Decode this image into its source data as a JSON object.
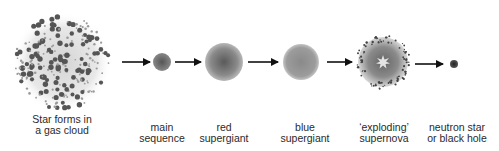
{
  "diagram": {
    "stages": [
      {
        "id": "gas-cloud",
        "line1": "Star forms in",
        "line2": "a gas cloud",
        "cx": 62,
        "cy": 62,
        "r": 48
      },
      {
        "id": "main-sequence",
        "line1": "main",
        "line2": "sequence",
        "cx": 162,
        "cy": 62,
        "r": 9
      },
      {
        "id": "red-supergiant",
        "line1": "red",
        "line2": "supergiant",
        "cx": 224,
        "cy": 62,
        "r": 19
      },
      {
        "id": "blue-supergiant",
        "line1": "blue",
        "line2": "supergiant",
        "cx": 301,
        "cy": 62,
        "r": 18
      },
      {
        "id": "supernova",
        "line1": "‘exploding’",
        "line2": "supernova",
        "cx": 383,
        "cy": 62,
        "r": 25
      },
      {
        "id": "neutron-star",
        "line1": "neutron star",
        "line2": "or black hole",
        "cx": 454,
        "cy": 64,
        "r": 4
      }
    ],
    "arrows": [
      {
        "from": "gas-cloud",
        "to": "main-sequence",
        "x1": 122,
        "x2": 150,
        "y": 62
      },
      {
        "from": "main-sequence",
        "to": "red-supergiant",
        "x1": 175,
        "x2": 201,
        "y": 62
      },
      {
        "from": "red-supergiant",
        "to": "blue-supergiant",
        "x1": 248,
        "x2": 278,
        "y": 62
      },
      {
        "from": "blue-supergiant",
        "to": "supernova",
        "x1": 327,
        "x2": 352,
        "y": 62
      },
      {
        "from": "supernova",
        "to": "neutron-star",
        "x1": 415,
        "x2": 443,
        "y": 64
      }
    ],
    "colors": {
      "background": "#ffffff",
      "arrow": "#111111",
      "text": "#2a2a2a",
      "star_core": "#555555",
      "star_edge": "#bbbbbb"
    }
  }
}
